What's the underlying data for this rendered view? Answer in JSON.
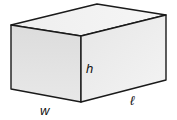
{
  "figure": {
    "type": "rectangular-prism",
    "labels": {
      "height": "h",
      "width": "w",
      "length": "ℓ"
    },
    "colors": {
      "stroke": "#1a1a1a",
      "front_face": "#e2e2e2",
      "right_face": "#ececec",
      "top_face": "#f2f2f2",
      "background": "#ffffff"
    }
  }
}
